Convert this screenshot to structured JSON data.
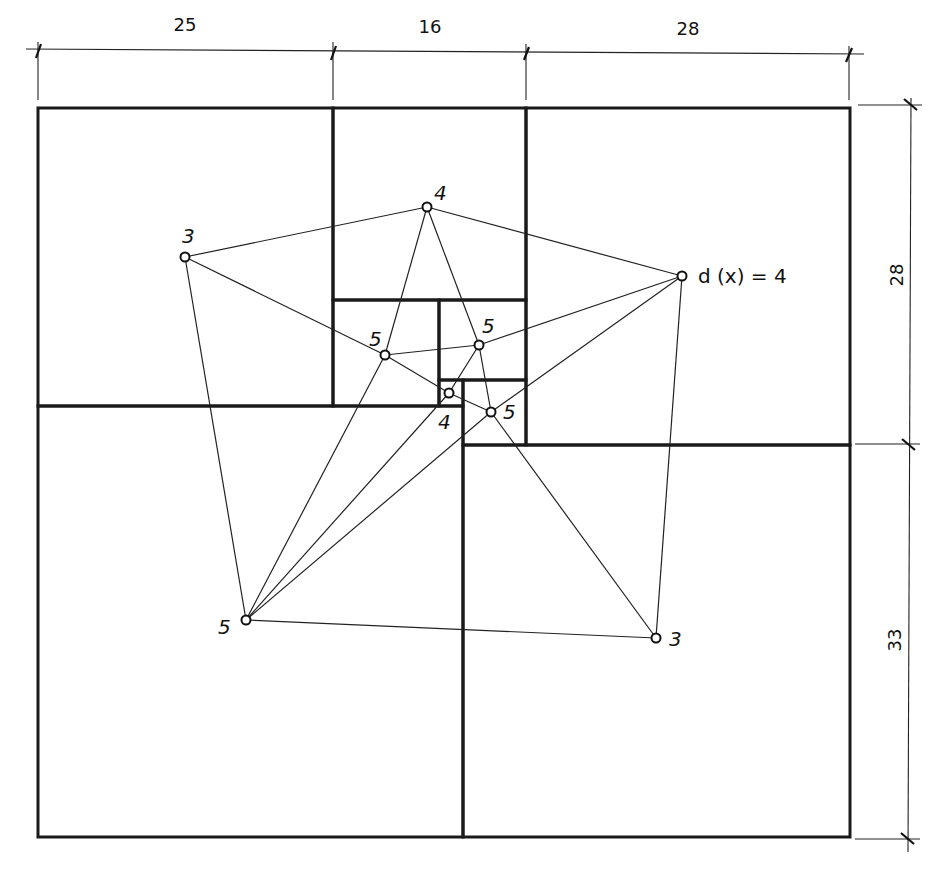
{
  "figure": {
    "type": "squared-rectangle-with-dual-graph",
    "dimensions": {
      "top": [
        "25",
        "16",
        "28"
      ],
      "right": [
        "28",
        "33"
      ]
    },
    "vertex_annotation": "d (x) = 4",
    "vertices": [
      {
        "id": "A",
        "label": "3",
        "x": 185,
        "y": 257,
        "lx": 182,
        "ly": 243
      },
      {
        "id": "B",
        "label": "4",
        "x": 427,
        "y": 207,
        "lx": 434,
        "ly": 200
      },
      {
        "id": "C",
        "label": "",
        "x": 682,
        "y": 276,
        "lx": 0,
        "ly": 0
      },
      {
        "id": "D",
        "label": "5",
        "x": 385,
        "y": 355,
        "lx": 369,
        "ly": 346
      },
      {
        "id": "E",
        "label": "5",
        "x": 479,
        "y": 345,
        "lx": 482,
        "ly": 333
      },
      {
        "id": "F",
        "label": "4",
        "x": 449,
        "y": 393,
        "lx": 438,
        "ly": 429
      },
      {
        "id": "G",
        "label": "5",
        "x": 491,
        "y": 412,
        "lx": 503,
        "ly": 419
      },
      {
        "id": "H",
        "label": "5",
        "x": 246,
        "y": 620,
        "lx": 218,
        "ly": 634
      },
      {
        "id": "I",
        "label": "3",
        "x": 656,
        "y": 638,
        "lx": 669,
        "ly": 646
      }
    ],
    "edges": [
      [
        "A",
        "B"
      ],
      [
        "A",
        "D"
      ],
      [
        "A",
        "H"
      ],
      [
        "B",
        "C"
      ],
      [
        "B",
        "D"
      ],
      [
        "B",
        "E"
      ],
      [
        "C",
        "E"
      ],
      [
        "C",
        "G"
      ],
      [
        "C",
        "I"
      ],
      [
        "D",
        "E"
      ],
      [
        "D",
        "F"
      ],
      [
        "D",
        "H"
      ],
      [
        "E",
        "F"
      ],
      [
        "E",
        "G"
      ],
      [
        "F",
        "G"
      ],
      [
        "F",
        "H"
      ],
      [
        "G",
        "H"
      ],
      [
        "G",
        "I"
      ],
      [
        "H",
        "I"
      ]
    ],
    "squares": [
      {
        "x": 38,
        "y": 108,
        "w": 295,
        "h": 298,
        "side": "25"
      },
      {
        "x": 333,
        "y": 108,
        "w": 193,
        "h": 192,
        "side": "16"
      },
      {
        "x": 526,
        "y": 108,
        "w": 324,
        "h": 337,
        "side": "28"
      },
      {
        "x": 333,
        "y": 300,
        "w": 106,
        "h": 106,
        "side": "9"
      },
      {
        "x": 439,
        "y": 300,
        "w": 87,
        "h": 80,
        "side": "7"
      },
      {
        "x": 439,
        "y": 380,
        "w": 24,
        "h": 26,
        "side": "2"
      },
      {
        "x": 463,
        "y": 380,
        "w": 63,
        "h": 65,
        "side": "5"
      },
      {
        "x": 38,
        "y": 406,
        "w": 425,
        "h": 431,
        "side": "36"
      },
      {
        "x": 463,
        "y": 445,
        "w": 387,
        "h": 392,
        "side": "33"
      }
    ]
  }
}
